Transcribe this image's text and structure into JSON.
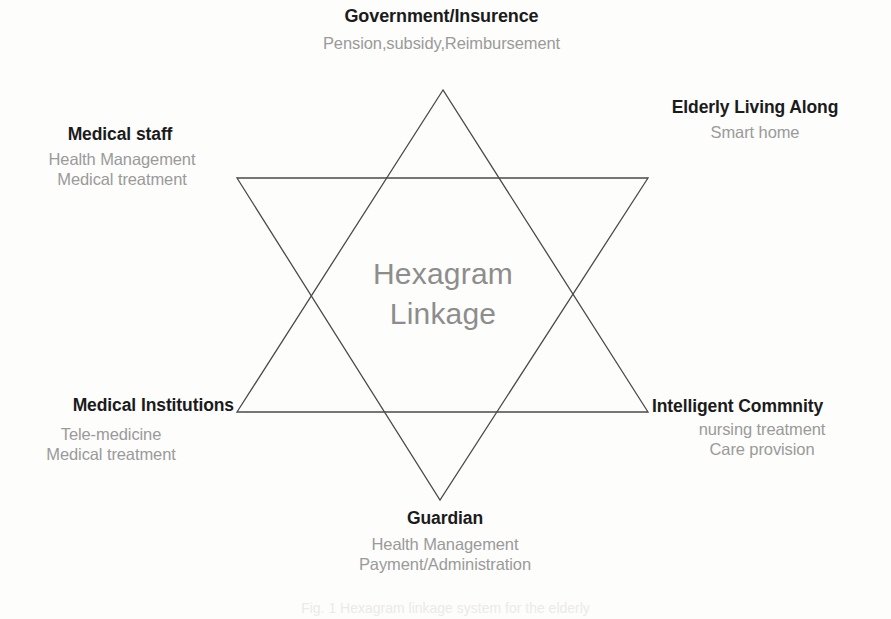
{
  "figure": {
    "center": {
      "line1": "Hexagram",
      "line2": "Linkage"
    },
    "caption": "Fig. 1   Hexagram linkage system for the elderly",
    "background_color": "#fdfdfc",
    "stroke_color": "#4a4a4a",
    "title_color": "#1b1b1b",
    "detail_color": "#9a9a9a",
    "center_text_color": "#8d8d8d"
  },
  "nodes": [
    {
      "id": "government",
      "title": "Government/Insurence",
      "details": [
        "Pension,subsidy,Reimbursement"
      ],
      "position": "top"
    },
    {
      "id": "elderly",
      "title": "Elderly Living Along",
      "details": [
        "Smart home"
      ],
      "position": "top-right"
    },
    {
      "id": "medical-staff",
      "title": "Medical staff",
      "details": [
        "Health Management",
        "Medical treatment"
      ],
      "position": "top-left"
    },
    {
      "id": "medical-institutions",
      "title": "Medical Institutions",
      "details": [
        "Tele-medicine",
        "Medical treatment"
      ],
      "position": "bottom-left"
    },
    {
      "id": "intelligent-community",
      "title": "Intelligent Commnity",
      "details": [
        "nursing treatment",
        "Care provision"
      ],
      "position": "bottom-right"
    },
    {
      "id": "guardian",
      "title": "Guardian",
      "details": [
        "Health Management",
        "Payment/Administration"
      ],
      "position": "bottom"
    }
  ],
  "geometry": {
    "triangle_up": "443,90 237,412 648,412",
    "triangle_down": "237,178 648,178 440,500"
  }
}
